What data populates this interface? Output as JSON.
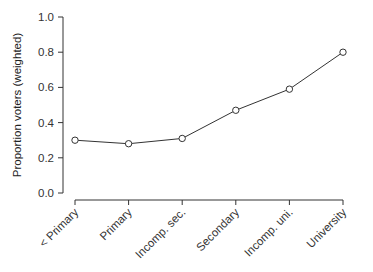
{
  "chart_data": {
    "type": "line",
    "title": "",
    "xlabel": "",
    "ylabel": "Proportion voters (weighted)",
    "categories": [
      "< Primary",
      "Primary",
      "Incomp. sec.",
      "Secondary",
      "Incomp. uni.",
      "University"
    ],
    "values": [
      0.3,
      0.28,
      0.31,
      0.47,
      0.59,
      0.8
    ],
    "ylim": [
      0.0,
      1.0
    ],
    "yticks": [
      0.0,
      0.2,
      0.4,
      0.6,
      0.8,
      1.0
    ],
    "ytick_labels": [
      "0.0",
      "0.2",
      "0.4",
      "0.6",
      "0.8",
      "1.0"
    ],
    "grid": false,
    "legend": null,
    "marker": "open-circle",
    "line_color": "#333333"
  }
}
